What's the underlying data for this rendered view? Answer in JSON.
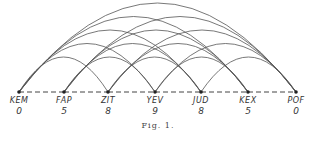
{
  "figure": {
    "caption": "Fig. 1.",
    "nodes": [
      {
        "label": "KEM",
        "value": "0",
        "x": 19
      },
      {
        "label": "FAP",
        "value": "5",
        "x": 64
      },
      {
        "label": "ZIT",
        "value": "8",
        "x": 108
      },
      {
        "label": "YEV",
        "value": "9",
        "x": 155
      },
      {
        "label": "JUD",
        "value": "8",
        "x": 201
      },
      {
        "label": "KEX",
        "value": "5",
        "x": 248
      },
      {
        "label": "POF",
        "value": "0",
        "x": 296
      }
    ],
    "baseline_y": 92,
    "adjacent_edge_style": "dashed",
    "nonadjacent_edge_style": "arc",
    "colors": {
      "line": "#555555",
      "text": "#333333"
    }
  }
}
